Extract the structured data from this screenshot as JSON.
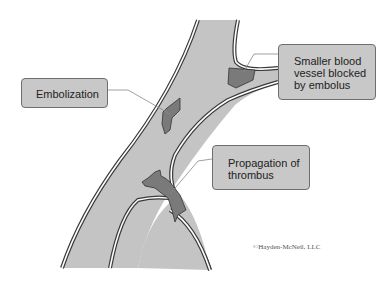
{
  "labels": {
    "smaller_vessel": "Smaller blood vessel blocked by embolus",
    "embolization": "Embolization",
    "propagation": "Propagation of thrombus"
  },
  "copyright": "©Hayden-McNeil, LLC",
  "colors": {
    "vessel_fill": "#c4c4c4",
    "vessel_wall": "#3a3a3a",
    "clot_fill": "#7a7a7a",
    "label_fill": "#c8c8c8"
  }
}
